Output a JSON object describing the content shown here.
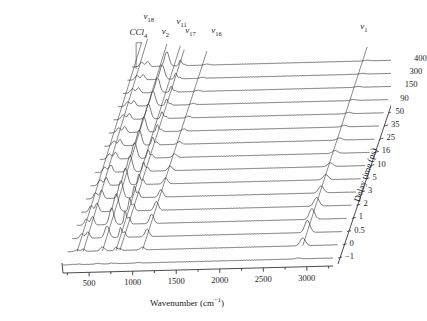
{
  "figure": {
    "type": "waterfall-spectra",
    "background": "#ffffff",
    "line_color": "#222222"
  },
  "axes": {
    "x": {
      "title_main": "Wavenumber (cm",
      "title_sup": "−1",
      "title_tail": ")",
      "title_full": "Wavenumber (cm⁻¹)",
      "ticks": [
        500,
        1000,
        1500,
        2000,
        2500,
        3000
      ],
      "tick_labels": [
        "500",
        "1000",
        "1500",
        "2000",
        "2500",
        "3000"
      ],
      "min": 200,
      "max": 3300,
      "minor_between": 1
    },
    "y": {
      "title_main": "Delay time (ps)",
      "labels": [
        "400",
        "300",
        "150",
        "90",
        "50",
        "35",
        "25",
        "16",
        "10",
        "5",
        "3",
        "2",
        "1",
        "0.5",
        "0",
        "−1"
      ],
      "values": [
        400,
        300,
        150,
        90,
        50,
        35,
        25,
        16,
        10,
        5,
        3,
        2,
        1,
        0.5,
        0,
        -1
      ]
    }
  },
  "peak_labels": [
    {
      "name": "CCl4",
      "text_main": "CCl",
      "text_sub": "4",
      "italic": false
    },
    {
      "name": "nu18",
      "text_main": "ν",
      "text_sub": "18",
      "italic": true
    },
    {
      "name": "nu2",
      "text_main": "ν",
      "text_sub": "2",
      "italic": true
    },
    {
      "name": "nu11",
      "text_main": "ν",
      "text_sub": "11",
      "italic": true
    },
    {
      "name": "nu17",
      "text_main": "ν",
      "text_sub": "17",
      "italic": true
    },
    {
      "name": "nu16",
      "text_main": "ν",
      "text_sub": "16",
      "italic": true
    },
    {
      "name": "nu1",
      "text_main": "ν",
      "text_sub": "1",
      "italic": true
    }
  ],
  "chart_data": {
    "type": "line",
    "title": "",
    "xlabel": "Wavenumber (cm⁻¹)",
    "ylabel": "Delay time (ps)",
    "xlim": [
      200,
      3300
    ],
    "grid": false,
    "legend": "none",
    "style": "stacked waterfall, each trace offset vertically and sheared to the right with increasing delay time",
    "x_ticks": [
      500,
      1000,
      1500,
      2000,
      2500,
      3000
    ],
    "annotations": [
      {
        "label": "CCl4",
        "wavenumber": 310
      },
      {
        "label": "ν18",
        "wavenumber": 380
      },
      {
        "label": "ν2",
        "wavenumber": 600
      },
      {
        "label": "ν11",
        "wavenumber": 760
      },
      {
        "label": "ν17",
        "wavenumber": 800
      },
      {
        "label": "ν16",
        "wavenumber": 1060
      },
      {
        "label": "ν1",
        "wavenumber": 2900
      }
    ],
    "peaks": [
      {
        "label": "CCl4",
        "center": 310,
        "width": 22
      },
      {
        "label": "ν18",
        "center": 380,
        "width": 20
      },
      {
        "label": "ν2",
        "center": 600,
        "width": 26
      },
      {
        "label": "ν11",
        "center": 755,
        "width": 14
      },
      {
        "label": "ν17",
        "center": 800,
        "width": 16
      },
      {
        "label": "ν16",
        "center": 1060,
        "width": 24
      },
      {
        "label": "ν1",
        "center": 2900,
        "width": 30
      }
    ],
    "series": [
      {
        "name": "400",
        "delay": 400,
        "amplitudes": [
          0.3,
          0.34,
          0.95,
          0.38,
          0.1,
          0.07,
          0.05
        ]
      },
      {
        "name": "300",
        "delay": 300,
        "amplitudes": [
          0.3,
          0.34,
          0.95,
          0.38,
          0.1,
          0.07,
          0.05
        ]
      },
      {
        "name": "150",
        "delay": 150,
        "amplitudes": [
          0.3,
          0.35,
          0.95,
          0.4,
          0.11,
          0.08,
          0.06
        ]
      },
      {
        "name": "90",
        "delay": 90,
        "amplitudes": [
          0.31,
          0.36,
          0.96,
          0.42,
          0.12,
          0.09,
          0.07
        ]
      },
      {
        "name": "50",
        "delay": 50,
        "amplitudes": [
          0.32,
          0.38,
          0.98,
          0.45,
          0.14,
          0.11,
          0.09
        ]
      },
      {
        "name": "35",
        "delay": 35,
        "amplitudes": [
          0.33,
          0.4,
          1.0,
          0.48,
          0.16,
          0.14,
          0.11
        ]
      },
      {
        "name": "25",
        "delay": 25,
        "amplitudes": [
          0.34,
          0.42,
          1.02,
          0.52,
          0.19,
          0.18,
          0.14
        ]
      },
      {
        "name": "16",
        "delay": 16,
        "amplitudes": [
          0.35,
          0.45,
          1.05,
          0.56,
          0.23,
          0.24,
          0.18
        ]
      },
      {
        "name": "10",
        "delay": 10,
        "amplitudes": [
          0.36,
          0.48,
          1.08,
          0.62,
          0.28,
          0.31,
          0.24
        ]
      },
      {
        "name": "5",
        "delay": 5,
        "amplitudes": [
          0.38,
          0.52,
          1.12,
          0.7,
          0.34,
          0.4,
          0.34
        ]
      },
      {
        "name": "3",
        "delay": 3,
        "amplitudes": [
          0.4,
          0.56,
          1.16,
          0.78,
          0.4,
          0.5,
          0.46
        ]
      },
      {
        "name": "2",
        "delay": 2,
        "amplitudes": [
          0.41,
          0.58,
          1.18,
          0.84,
          0.45,
          0.58,
          0.58
        ]
      },
      {
        "name": "1",
        "delay": 1,
        "amplitudes": [
          0.4,
          0.56,
          1.1,
          0.86,
          0.46,
          0.62,
          0.72
        ]
      },
      {
        "name": "0.5",
        "delay": 0.5,
        "amplitudes": [
          0.3,
          0.42,
          0.78,
          0.66,
          0.36,
          0.5,
          0.8
        ]
      },
      {
        "name": "0",
        "delay": 0,
        "amplitudes": [
          0.12,
          0.16,
          0.26,
          0.24,
          0.13,
          0.18,
          0.52
        ]
      },
      {
        "name": "−1",
        "delay": -1,
        "amplitudes": [
          0.03,
          0.04,
          0.05,
          0.05,
          0.03,
          0.04,
          0.06
        ]
      }
    ]
  }
}
